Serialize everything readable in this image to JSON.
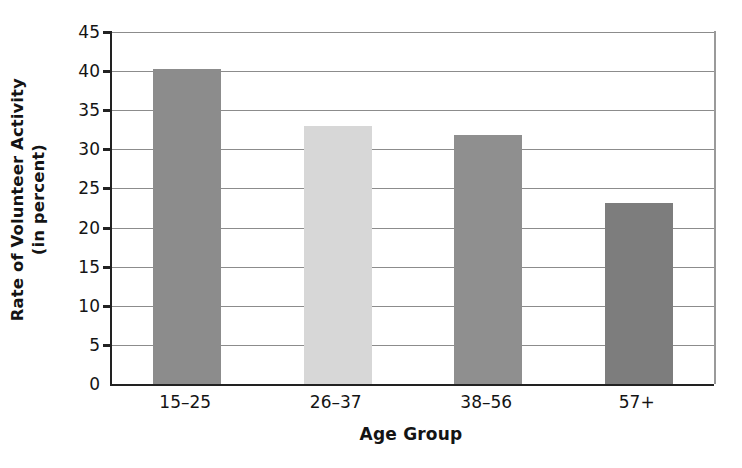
{
  "chart_data": {
    "type": "bar",
    "title": "",
    "subtitle": "",
    "xlabel": "Age Group",
    "ylabel": "Rate of Volunteer Activity (in percent)",
    "ylabel_line1": "Rate of Volunteer Activity",
    "ylabel_line2": "(in percent)",
    "categories": [
      "15–25",
      "26–37",
      "38–56",
      "57+"
    ],
    "values": [
      40.3,
      33.0,
      31.8,
      23.1
    ],
    "bar_colors": [
      "#8c8c8c",
      "#d7d7d7",
      "#8f8f8f",
      "#7d7d7d"
    ],
    "ylim": [
      0,
      45
    ],
    "yticks": [
      0,
      5,
      10,
      15,
      20,
      25,
      30,
      35,
      40,
      45
    ],
    "ytick_labels": [
      "0",
      "5",
      "10",
      "15",
      "20",
      "25",
      "30",
      "35",
      "40",
      "45"
    ],
    "grid": true,
    "grid_axis": "y",
    "legend": false,
    "legend_position": "none",
    "axis_color": "#222222",
    "grid_color": "#8c8c8c",
    "background": "#ffffff",
    "bar_width_ratio": 0.45
  }
}
